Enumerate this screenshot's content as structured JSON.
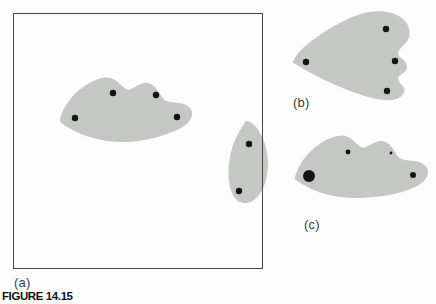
{
  "figure": {
    "caption": "FIGURE 14.15",
    "colors": {
      "background": "#fdfdfd",
      "blob_fill": "#c5c7c4",
      "dot_fill": "#141414",
      "frame_stroke": "#454545",
      "label_text": "#3f3f3f",
      "caption_text": "#141414"
    },
    "panels": [
      {
        "id": "a",
        "label": "(a)",
        "frame": {
          "x": 13.5,
          "y": 13.5,
          "width": 249,
          "height": 255
        },
        "blobs": [
          {
            "name": "blob-a-main",
            "path": "M60 119 C63 107 73 93 86 85 C94 80 104 76 111 78 C117 80 120 85 126 89 C131 92 136 84 145 83 C152 82 157 88 162 97 C165 102 170 102 179 103 C188 104 193 109 192 115 C191 121 186 126 177 130 C163 136 147 141 127 142 C104 143 82 136 69 128 C62 124 59 122 60 119 Z",
            "dots": [
              {
                "x": 75,
                "y": 118,
                "r": 3.2
              },
              {
                "x": 113,
                "y": 93,
                "r": 3.2
              },
              {
                "x": 156,
                "y": 95,
                "r": 3.2
              },
              {
                "x": 177,
                "y": 117,
                "r": 3.2
              }
            ]
          },
          {
            "name": "blob-a-right-edge",
            "path": "M247 121 C252 122 257 127 260 133 C265 142 268 152 268 163 C268 173 266 184 261 192 C257 199 250 204 243 203 C236 202 232 195 230 187 C228 179 228 168 230 157 C232 147 236 136 241 129 C243 125 245 121 247 121 Z",
            "dots": [
              {
                "x": 249,
                "y": 144,
                "r": 3.2
              },
              {
                "x": 239,
                "y": 191,
                "r": 3.2
              }
            ]
          }
        ]
      },
      {
        "id": "b",
        "label": "(b)",
        "blobs": [
          {
            "name": "blob-b",
            "path": "M293 62 C295 55 304 46 317 37 C331 27 352 15 369 12 C382 10 396 12 404 20 C410 26 411 34 408 40 C405 45 399 48 398 53 C398 57 403 58 406 63 C408 67 407 71 402 74 C398 76 397 79 400 83 C404 87 406 90 403 94 C400 99 393 101 385 100 C371 99 354 93 338 86 C321 79 305 70 297 65 C294 63 292 62 293 62 Z",
            "dots": [
              {
                "x": 386,
                "y": 29,
                "r": 3.2
              },
              {
                "x": 306,
                "y": 62,
                "r": 3.2
              },
              {
                "x": 395,
                "y": 61,
                "r": 3.2
              },
              {
                "x": 387,
                "y": 91,
                "r": 3.2
              }
            ]
          }
        ]
      },
      {
        "id": "c",
        "label": "(c)",
        "blobs": [
          {
            "name": "blob-c",
            "path": "M295 177 C298 165 308 151 321 143 C329 138 339 134 346 136 C352 138 355 143 361 147 C366 150 371 142 380 141 C387 140 392 146 397 155 C400 160 405 160 414 161 C423 162 429 167 428 173 C427 179 422 184 413 188 C399 194 381 197 361 198 C338 199 317 193 304 185 C297 181 294 180 295 177 Z",
            "dots": [
              {
                "x": 309,
                "y": 176,
                "r": 6
              },
              {
                "x": 348,
                "y": 152,
                "r": 2.4
              },
              {
                "x": 391,
                "y": 153,
                "r": 1.4
              },
              {
                "x": 413,
                "y": 175,
                "r": 3
              }
            ]
          }
        ]
      }
    ]
  }
}
